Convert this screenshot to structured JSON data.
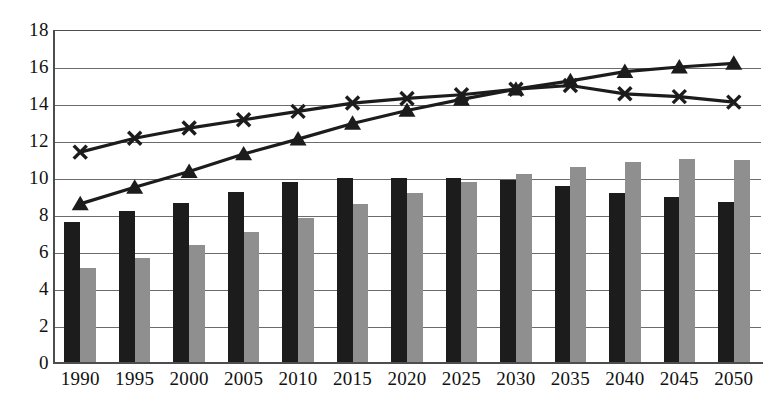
{
  "chart_data": {
    "type": "bar",
    "title": "",
    "subtitle": "",
    "xlabel": "",
    "ylabel": "",
    "ylim": [
      0,
      18
    ],
    "ytick_step": 2,
    "yticks": [
      "18",
      "16",
      "14",
      "12",
      "10",
      "8",
      "6",
      "4",
      "2",
      "0"
    ],
    "grid": true,
    "legend": "none",
    "categories": [
      "1990",
      "1995",
      "2000",
      "2005",
      "2010",
      "2015",
      "2020",
      "2025",
      "2030",
      "2035",
      "2040",
      "2045",
      "2050"
    ],
    "series": [
      {
        "name": "dark-bars",
        "type": "bar",
        "color": "#1c1c1c",
        "marker": "none",
        "values": [
          7.6,
          8.2,
          8.65,
          9.25,
          9.8,
          10.0,
          10.0,
          10.0,
          9.9,
          9.55,
          9.2,
          9.0,
          8.7
        ]
      },
      {
        "name": "gray-bars",
        "type": "bar",
        "color": "#8f8f8f",
        "marker": "none",
        "values": [
          5.15,
          5.7,
          6.4,
          7.1,
          7.85,
          8.6,
          9.2,
          9.8,
          10.2,
          10.6,
          10.85,
          11.05,
          11.0
        ]
      },
      {
        "name": "triangle-line",
        "type": "line",
        "color": "#1c1c1c",
        "marker": "triangle",
        "values": [
          8.6,
          9.5,
          10.35,
          11.3,
          12.1,
          12.95,
          13.65,
          14.25,
          14.8,
          15.25,
          15.75,
          16.0,
          16.2
        ]
      },
      {
        "name": "cross-line",
        "type": "line",
        "color": "#1c1c1c",
        "marker": "x",
        "values": [
          11.4,
          12.15,
          12.7,
          13.15,
          13.6,
          14.05,
          14.3,
          14.5,
          14.8,
          15.0,
          14.55,
          14.4,
          14.1
        ]
      }
    ]
  }
}
